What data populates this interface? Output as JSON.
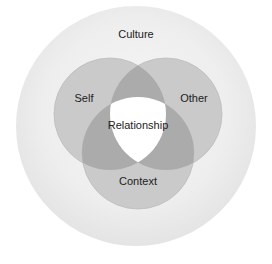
{
  "diagram": {
    "outer": {
      "label": "Culture",
      "color": "#ececec"
    },
    "circles": [
      {
        "id": "self",
        "label": "Self"
      },
      {
        "id": "other",
        "label": "Other"
      },
      {
        "id": "context",
        "label": "Context"
      }
    ],
    "center": {
      "label": "Relationship"
    },
    "colors": {
      "circle_fill": "#c8c8c8",
      "pair_overlap": "#a9a9a9",
      "center_fill": "#ffffff",
      "stroke": "#b3b3b3"
    }
  }
}
